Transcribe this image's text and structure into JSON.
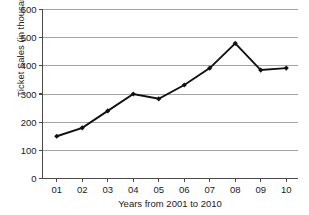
{
  "chart_data": {
    "type": "line",
    "title": "",
    "xlabel": "Years from 2001 to 2010",
    "ylabel": "Ticket Sales (in thousands)",
    "categories": [
      "01",
      "02",
      "03",
      "04",
      "05",
      "06",
      "07",
      "08",
      "09",
      "10"
    ],
    "values": [
      150,
      180,
      240,
      300,
      283,
      332,
      392,
      480,
      385,
      392
    ],
    "series": [
      {
        "name": "Ticket Sales",
        "values": [
          150,
          180,
          240,
          300,
          283,
          332,
          392,
          480,
          385,
          392
        ]
      }
    ],
    "ylim": [
      0,
      600
    ],
    "ytick_labels": [
      "0",
      "100",
      "200",
      "300",
      "400",
      "500",
      "600"
    ],
    "ytick_values": [
      0,
      100,
      200,
      300,
      400,
      500,
      600
    ],
    "xtick_labels": [
      "01",
      "02",
      "03",
      "04",
      "05",
      "06",
      "07",
      "08",
      "09",
      "10"
    ],
    "grid": "horizontal",
    "legend": "none",
    "marker": "diamond",
    "colors": {
      "line": "#111111",
      "marker": "#111111",
      "gridline": "#9a9a9a",
      "axis": "#4a4a4a",
      "background": "#ffffff",
      "text": "#1a1a1a"
    }
  }
}
